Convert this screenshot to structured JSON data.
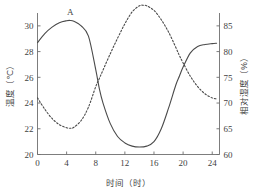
{
  "chart_data": {
    "type": "line",
    "title": "",
    "xlabel": "时间（时）",
    "xlim": [
      0,
      25
    ],
    "xticks": [
      0,
      4,
      8,
      12,
      16,
      20,
      24
    ],
    "xtick_labels": [
      "0",
      "4",
      "8",
      "12",
      "16",
      "20",
      "24"
    ],
    "grid": false,
    "legend": "inline-curve-labels",
    "axes": [
      {
        "id": "left",
        "label": "温度（℃）",
        "unit": "℃",
        "lim": [
          20,
          31
        ],
        "ticks": [
          20,
          22,
          24,
          26,
          28,
          30
        ],
        "tick_labels": [
          "20",
          "22",
          "24",
          "26",
          "28",
          "30"
        ]
      },
      {
        "id": "right",
        "label": "相对湿度（%）",
        "unit": "%",
        "lim": [
          60,
          87.5
        ],
        "ticks": [
          60,
          65,
          70,
          75,
          80,
          85,
          90
        ],
        "tick_labels": [
          "60",
          "65",
          "70",
          "75",
          "80",
          "85",
          "90"
        ]
      }
    ],
    "series": [
      {
        "name": "A",
        "annotation": "A",
        "axis": "left",
        "style": "solid",
        "quantity": "温度",
        "unit": "℃",
        "x": [
          0,
          1,
          2,
          3,
          4,
          4.5,
          5,
          6,
          7,
          8,
          8.5,
          9,
          10,
          11,
          12,
          13,
          14,
          15,
          16,
          17,
          18,
          19,
          19.5,
          20,
          21,
          22,
          23,
          24,
          24.6
        ],
        "values": [
          28.7,
          29.4,
          29.9,
          30.25,
          30.4,
          30.42,
          30.35,
          30.0,
          29.2,
          26.6,
          25.1,
          24.0,
          22.4,
          21.4,
          20.9,
          20.65,
          20.58,
          20.65,
          21.0,
          22.0,
          23.6,
          25.4,
          26.1,
          26.8,
          27.9,
          28.4,
          28.55,
          28.62,
          28.65
        ],
        "peak": {
          "x": 4.5,
          "value": 30.4
        },
        "min": {
          "x": 14,
          "value": 20.6
        },
        "start": {
          "x": 0,
          "value": 28.7
        },
        "end": {
          "x": 24.6,
          "value": 28.65
        }
      },
      {
        "name": "B",
        "annotation": "B",
        "axis": "right",
        "style": "dashed",
        "quantity": "相对湿度",
        "unit": "%",
        "x": [
          0,
          1,
          2,
          3,
          4,
          4.6,
          5,
          6,
          7,
          8,
          8.5,
          9,
          10,
          11,
          12,
          13,
          14,
          14.6,
          15,
          16,
          17,
          18,
          19,
          19.5,
          20,
          21,
          22,
          23,
          24,
          24.6
        ],
        "values": [
          71.0,
          68.8,
          67.0,
          65.8,
          65.2,
          65.1,
          65.3,
          66.6,
          69.2,
          73.2,
          74.8,
          76.4,
          79.6,
          82.6,
          85.4,
          87.7,
          88.9,
          89.0,
          88.9,
          88.0,
          86.2,
          83.8,
          80.8,
          79.2,
          77.8,
          75.2,
          73.2,
          71.8,
          71.0,
          70.8
        ],
        "peak": {
          "x": 14.6,
          "value": 89.0
        },
        "min": {
          "x": 4.6,
          "value": 65.1
        },
        "start": {
          "x": 0,
          "value": 71.0
        },
        "end": {
          "x": 24.6,
          "value": 70.8
        }
      }
    ],
    "intersections": [
      {
        "x": 8.5,
        "temperature": 25.1,
        "humidity": 74.8
      },
      {
        "x": 19.5,
        "temperature": 26.1,
        "humidity": 79.2
      }
    ]
  },
  "colors": {
    "background": "#ffffff",
    "axis": "#6e6e6e",
    "curve": "#4a4a4a",
    "text": "#3f3f3f"
  }
}
